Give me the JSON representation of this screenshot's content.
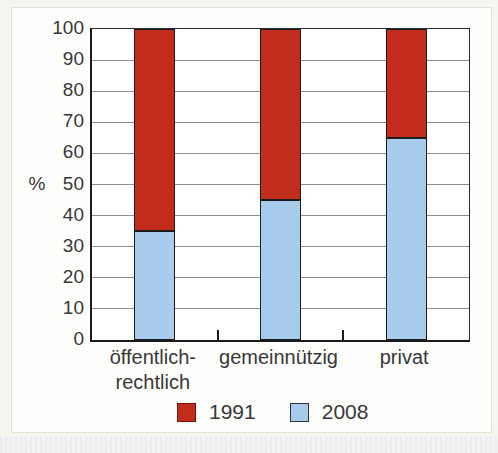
{
  "page": {
    "background": "#f5f5f1",
    "panel_background": "#fefefd",
    "panel_border": "#e2e2da",
    "scan_stripe_colors": [
      "#e7ebed",
      "#f2f4f4"
    ]
  },
  "chart_data": {
    "type": "bar",
    "stacked": true,
    "title": "",
    "xlabel": "",
    "ylabel": "%",
    "ylim": [
      0,
      100
    ],
    "yticks": [
      0,
      10,
      20,
      30,
      40,
      50,
      60,
      70,
      80,
      90,
      100
    ],
    "grid": "horizontal",
    "gridline_color": "#8c8c8c",
    "axis_color": "#1a1a1a",
    "bar_border_color": "#1b1b1b",
    "text_color": "#383838",
    "categories": [
      "öffentlich-rechtlich",
      "gemeinnützig",
      "privat"
    ],
    "category_label_lines": [
      [
        "öffentlich-",
        "rechtlich"
      ],
      [
        "gemeinnützig"
      ],
      [
        "privat"
      ]
    ],
    "series": [
      {
        "name": "2008",
        "color": "#a6cbeb",
        "swatch_border": "#333333",
        "values": [
          35,
          45,
          65
        ]
      },
      {
        "name": "1991",
        "color": "#c12c1c",
        "swatch_border": "#7a120b",
        "values": [
          65,
          55,
          35
        ]
      }
    ],
    "legend_order": [
      "1991",
      "2008"
    ],
    "legend_position": "bottom"
  }
}
